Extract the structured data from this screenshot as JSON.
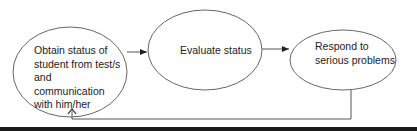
{
  "diagram": {
    "type": "flowchart-cycle",
    "nodes": [
      {
        "id": "obtain",
        "shape": "ellipse",
        "label_lines": [
          "Obtain status of",
          "student from test/s",
          "and communication",
          "with him/her"
        ]
      },
      {
        "id": "evaluate",
        "shape": "ellipse",
        "label_lines": [
          "Evaluate status"
        ]
      },
      {
        "id": "respond",
        "shape": "ellipse",
        "label_lines": [
          "Respond to",
          "serious problems"
        ]
      }
    ],
    "edges": [
      {
        "from": "obtain",
        "to": "evaluate",
        "style": "solid-arrow"
      },
      {
        "from": "evaluate",
        "to": "respond",
        "style": "solid-arrow"
      },
      {
        "from": "respond",
        "to": "obtain",
        "style": "open-arrow-feedback"
      }
    ],
    "colors": {
      "stroke": "#555555",
      "text": "#222222",
      "bar": "#1a1a1a",
      "background": "#ffffff"
    }
  }
}
